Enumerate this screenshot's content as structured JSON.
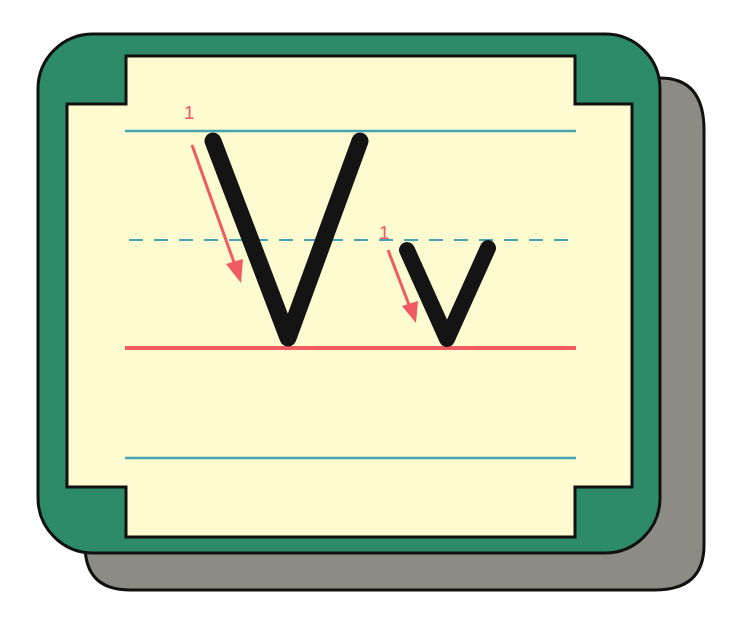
{
  "worksheet": {
    "letter_upper": "V",
    "letter_lower": "v",
    "upper_stroke_number": "1",
    "lower_stroke_number": "1"
  },
  "colors": {
    "card_green": "#2e8b6a",
    "shadow_gray": "#8c8c84",
    "panel_cream": "#fdfbcf",
    "outline_black": "#111111",
    "guide_blue": "#4aa3b0",
    "baseline_red": "#ef5a63",
    "arrow_red": "#ef5a63",
    "letter_black": "#141414"
  }
}
